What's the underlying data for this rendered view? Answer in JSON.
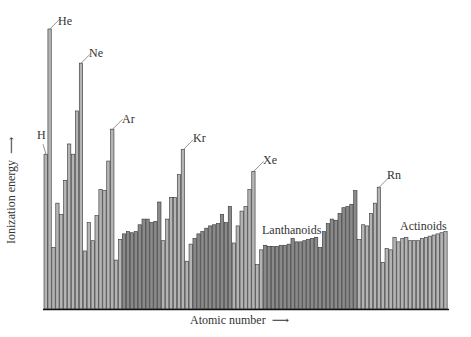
{
  "chart_data": {
    "type": "bar",
    "title": "",
    "xlabel": "Atomic number",
    "ylabel": "Ionization energy",
    "grid": false,
    "legend": null,
    "units": "eV (approximate, axis unlabeled)",
    "x": [
      1,
      2,
      3,
      4,
      5,
      6,
      7,
      8,
      9,
      10,
      11,
      12,
      13,
      14,
      15,
      16,
      17,
      18,
      19,
      20,
      21,
      22,
      23,
      24,
      25,
      26,
      27,
      28,
      29,
      30,
      31,
      32,
      33,
      34,
      35,
      36,
      37,
      38,
      39,
      40,
      41,
      42,
      43,
      44,
      45,
      46,
      47,
      48,
      49,
      50,
      51,
      52,
      53,
      54,
      55,
      56,
      57,
      58,
      59,
      60,
      61,
      62,
      63,
      64,
      65,
      66,
      67,
      68,
      69,
      70,
      71,
      72,
      73,
      74,
      75,
      76,
      77,
      78,
      79,
      80,
      81,
      82,
      83,
      84,
      85,
      86,
      87,
      88,
      89,
      90,
      91,
      92,
      93,
      94,
      95,
      96,
      97,
      98,
      99,
      100,
      101,
      102,
      103
    ],
    "values": [
      13.6,
      24.6,
      5.4,
      9.3,
      8.3,
      11.3,
      14.5,
      13.6,
      17.4,
      21.6,
      5.1,
      7.6,
      6.0,
      8.2,
      10.5,
      10.4,
      13.0,
      15.8,
      4.3,
      6.1,
      6.6,
      6.8,
      6.7,
      6.8,
      7.4,
      7.9,
      7.9,
      7.6,
      7.7,
      9.4,
      6.0,
      7.9,
      9.8,
      9.8,
      11.8,
      14.0,
      4.2,
      5.7,
      6.2,
      6.6,
      6.8,
      7.1,
      7.3,
      7.4,
      7.5,
      8.3,
      7.6,
      9.0,
      5.8,
      7.3,
      8.6,
      9.0,
      10.5,
      12.1,
      3.9,
      5.2,
      5.6,
      5.5,
      5.5,
      5.5,
      5.6,
      5.6,
      5.7,
      6.2,
      5.9,
      5.9,
      6.0,
      6.1,
      6.2,
      6.3,
      5.4,
      6.8,
      7.5,
      7.9,
      7.8,
      8.4,
      8.9,
      9.0,
      9.2,
      10.4,
      6.1,
      7.4,
      7.3,
      8.4,
      9.3,
      10.7,
      4.1,
      5.3,
      5.2,
      6.3,
      5.9,
      6.2,
      6.3,
      6.0,
      6.0,
      6.0,
      6.2,
      6.3,
      6.4,
      6.5,
      6.6,
      6.7,
      6.8
    ],
    "annotations": [
      {
        "label": "H",
        "z": 1
      },
      {
        "label": "He",
        "z": 2
      },
      {
        "label": "Ne",
        "z": 10
      },
      {
        "label": "Ar",
        "z": 18
      },
      {
        "label": "Kr",
        "z": 36
      },
      {
        "label": "Xe",
        "z": 54
      },
      {
        "label": "Lanthanoids",
        "z": 64
      },
      {
        "label": "Rn",
        "z": 86
      },
      {
        "label": "Actinoids",
        "z": 96
      }
    ],
    "dark_groups": [
      [
        21,
        30
      ],
      [
        39,
        48
      ],
      [
        57,
        80
      ]
    ],
    "colors": {
      "light": "#b4b4b4",
      "dark": "#8a8a8a",
      "edge": "#333333",
      "axis": "#111111"
    }
  },
  "labels": {
    "ylabel": "Ionization energy",
    "ylabel_arrow": "→",
    "xlabel": "Atomic number",
    "xlabel_arrow": "⟶",
    "H": "H",
    "He": "He",
    "Ne": "Ne",
    "Ar": "Ar",
    "Kr": "Kr",
    "Xe": "Xe",
    "Lanthanoids": "Lanthanoids",
    "Rn": "Rn",
    "Actinoids": "Actinoids"
  }
}
